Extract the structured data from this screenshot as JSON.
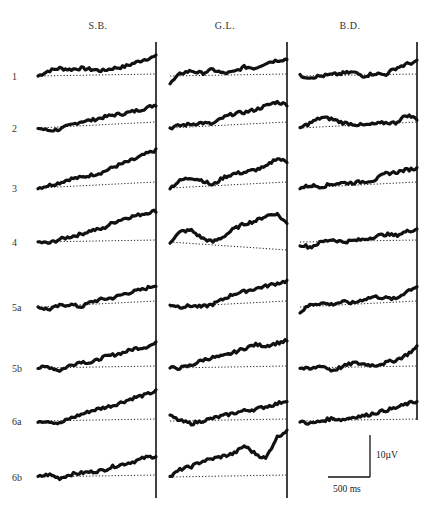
{
  "chart_data": {
    "type": "line",
    "title": "",
    "columns": [
      "S.B.",
      "G.L.",
      "B.D."
    ],
    "rows": [
      "1",
      "2",
      "3",
      "4",
      "5a",
      "5b",
      "6a",
      "6b"
    ],
    "xlabel": "time (ms)",
    "ylabel": "amplitude (µV)",
    "scale_bar": {
      "time": "500 ms",
      "amplitude": "10 µV"
    },
    "x_points": 12,
    "series": [
      {
        "subject": "S.B.",
        "row": "1",
        "values": [
          0,
          2,
          3,
          2.5,
          3,
          2.5,
          2,
          3,
          3.5,
          5,
          6.5,
          7.5
        ]
      },
      {
        "subject": "S.B.",
        "row": "2",
        "values": [
          0,
          -1,
          -0.5,
          1,
          2.5,
          3,
          4,
          5,
          5.5,
          6.5,
          7.5,
          9
        ]
      },
      {
        "subject": "S.B.",
        "row": "3",
        "values": [
          0,
          1,
          2,
          3.5,
          4,
          5,
          6,
          8,
          9.5,
          11,
          13,
          14.5
        ]
      },
      {
        "subject": "S.B.",
        "row": "4",
        "values": [
          0,
          -0.5,
          1,
          2,
          3,
          4.5,
          5,
          7.5,
          9,
          10,
          11,
          12
        ]
      },
      {
        "subject": "S.B.",
        "row": "5a",
        "values": [
          0,
          -1,
          0.5,
          1,
          0,
          2,
          3,
          3.5,
          5,
          6,
          7,
          8.5
        ]
      },
      {
        "subject": "S.B.",
        "row": "5b",
        "values": [
          0,
          0.5,
          -1,
          1,
          2.5,
          2,
          4,
          5,
          6,
          7.5,
          8,
          9.5
        ]
      },
      {
        "subject": "S.B.",
        "row": "6a",
        "values": [
          0,
          0,
          -1,
          1,
          2.5,
          4,
          5,
          6,
          7.5,
          9,
          10,
          11.5
        ]
      },
      {
        "subject": "S.B.",
        "row": "6b",
        "values": [
          0,
          1,
          -0.5,
          1,
          1.5,
          2,
          2.5,
          4,
          5,
          6,
          7.5,
          8
        ]
      },
      {
        "subject": "G.L.",
        "row": "1",
        "values": [
          -3,
          1,
          2,
          1,
          2.5,
          1,
          1.5,
          3.5,
          3,
          5,
          6,
          6.5
        ]
      },
      {
        "subject": "G.L.",
        "row": "2",
        "values": [
          0,
          1,
          1.5,
          2,
          1.5,
          4,
          5.5,
          6,
          7,
          8.5,
          10,
          9
        ]
      },
      {
        "subject": "G.L.",
        "row": "3",
        "values": [
          0,
          3,
          4,
          3,
          1,
          4,
          5.5,
          6,
          7,
          8,
          11.5,
          10
        ]
      },
      {
        "subject": "G.L.",
        "row": "4",
        "values": [
          0,
          4,
          4.5,
          1.5,
          0,
          2,
          5,
          7,
          8,
          10,
          11,
          7
        ]
      },
      {
        "subject": "G.L.",
        "row": "5a",
        "values": [
          1,
          0,
          0.5,
          0,
          1,
          3,
          5,
          6,
          7,
          8,
          9,
          10
        ]
      },
      {
        "subject": "G.L.",
        "row": "5b",
        "values": [
          0,
          0,
          1,
          3,
          4,
          4.5,
          6,
          7.5,
          9,
          8.5,
          9.5,
          10.5
        ]
      },
      {
        "subject": "G.L.",
        "row": "6a",
        "values": [
          2,
          0,
          -1,
          0,
          1,
          2,
          3,
          4,
          4.5,
          5.5,
          6.5,
          8
        ]
      },
      {
        "subject": "G.L.",
        "row": "6b",
        "values": [
          0,
          3,
          4,
          6,
          7,
          8,
          9,
          12,
          9,
          7,
          15,
          18
        ]
      },
      {
        "subject": "B.D.",
        "row": "1",
        "values": [
          0,
          -0.5,
          0,
          0.5,
          1,
          1.5,
          0,
          1,
          0.5,
          3,
          4.5,
          5.5
        ]
      },
      {
        "subject": "B.D.",
        "row": "2",
        "values": [
          0,
          2,
          4,
          3.5,
          2,
          1.5,
          1,
          1.5,
          2,
          2,
          5,
          3.5
        ]
      },
      {
        "subject": "B.D.",
        "row": "3",
        "values": [
          0,
          1,
          0.5,
          1.5,
          2,
          2,
          2.5,
          3,
          5.5,
          6,
          7,
          7.5
        ]
      },
      {
        "subject": "B.D.",
        "row": "4",
        "values": [
          -1,
          -2,
          0,
          1,
          0,
          0.5,
          1,
          2,
          3,
          2.5,
          4,
          5
        ]
      },
      {
        "subject": "B.D.",
        "row": "5a",
        "values": [
          -2,
          1,
          1.5,
          1,
          2,
          1.5,
          3,
          4,
          3.5,
          3,
          6,
          8
        ]
      },
      {
        "subject": "B.D.",
        "row": "5b",
        "values": [
          0,
          -0.5,
          1,
          -1,
          0.5,
          2,
          1.5,
          1,
          2,
          3,
          5,
          8
        ]
      },
      {
        "subject": "B.D.",
        "row": "6a",
        "values": [
          0,
          -1,
          0,
          1,
          0.5,
          1.5,
          2,
          3,
          4,
          5,
          6.5,
          7.5
        ]
      }
    ],
    "grid": false,
    "legend": "none"
  },
  "labels": {
    "columns": [
      "S.B.",
      "G.L.",
      "B.D."
    ],
    "rows": [
      "1",
      "2",
      "3",
      "4",
      "5a",
      "5b",
      "6a",
      "6b"
    ],
    "scale_time": "500 ms",
    "scale_amp": "10µV",
    "caption_fragment": "... the average of 40 trials for each ..."
  }
}
